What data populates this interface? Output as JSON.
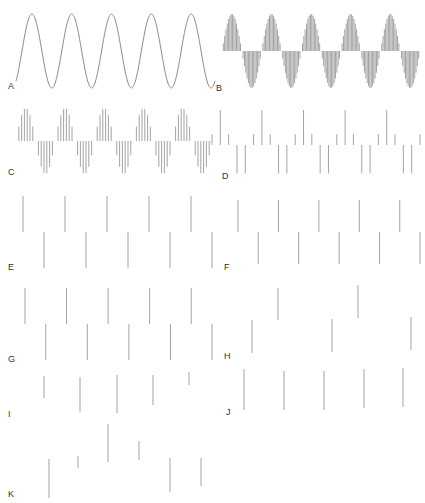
{
  "figure": {
    "stroke_color": "#8c8c8c",
    "label_color": "#333333"
  },
  "panels": [
    {
      "id": "A",
      "label": "A",
      "type": "continuous",
      "x0": 16,
      "x1": 215,
      "mid": 51,
      "amp": 37,
      "cycles": 5,
      "phase": -0.15,
      "label_x": 8,
      "label_y": 82
    },
    {
      "id": "B",
      "label": "B",
      "type": "sampled",
      "x0": 222,
      "x1": 420,
      "mid": 51,
      "amp": 37,
      "cycles": 5,
      "phase": 0.0,
      "samples_per_cycle": 30,
      "label_x": 216,
      "label_y": 84
    },
    {
      "id": "C",
      "label": "C",
      "type": "sampled",
      "x0": 16,
      "x1": 212,
      "mid": 141,
      "amp": 33,
      "cycles": 5,
      "phase": 0.0,
      "samples_per_cycle": 14,
      "label_x": 8,
      "label_y": 168
    },
    {
      "id": "D",
      "label": "D",
      "type": "sampled",
      "x0": 212,
      "x1": 420,
      "mid": 145,
      "amp": 35,
      "cycles": 5,
      "phase": 0.05,
      "samples_per_cycle": 5,
      "label_x": 222,
      "label_y": 172
    },
    {
      "id": "E",
      "label": "E",
      "type": "alternating",
      "x0": 23,
      "x1": 212,
      "mid": 232,
      "up_len": 36,
      "down_len": 36,
      "stems": 10,
      "label_x": 8,
      "label_y": 263
    },
    {
      "id": "F",
      "label": "F",
      "type": "alternating",
      "x0": 238,
      "x1": 420,
      "mid": 232,
      "up_len": 32,
      "down_len": 32,
      "stems": 10,
      "label_x": 224,
      "label_y": 263
    },
    {
      "id": "G",
      "label": "G",
      "type": "alternating",
      "x0": 25,
      "x1": 212,
      "mid": 324,
      "up_len": 36,
      "down_len": 36,
      "stems": 10,
      "label_x": 8,
      "label_y": 355
    },
    {
      "id": "H",
      "label": "H",
      "type": "custom",
      "stems_data": [
        [
          252,
          320,
          353
        ],
        [
          278,
          288,
          320
        ],
        [
          332,
          319,
          352
        ],
        [
          358,
          285,
          318
        ],
        [
          411,
          317,
          350
        ]
      ],
      "label_x": 224,
      "label_y": 352
    },
    {
      "id": "I",
      "label": "I",
      "type": "custom",
      "stems_data": [
        [
          44,
          376,
          398
        ],
        [
          80,
          377,
          412
        ],
        [
          117,
          375,
          413
        ],
        [
          153,
          375,
          405
        ],
        [
          189,
          372,
          385
        ]
      ],
      "label_x": 8,
      "label_y": 410
    },
    {
      "id": "J",
      "label": "J",
      "type": "custom",
      "stems_data": [
        [
          244,
          369,
          410
        ],
        [
          284,
          371,
          410
        ],
        [
          324,
          371,
          410
        ],
        [
          364,
          369,
          408
        ],
        [
          403,
          368,
          407
        ]
      ],
      "label_x": 226,
      "label_y": 408
    },
    {
      "id": "K",
      "label": "K",
      "type": "custom",
      "stems_data": [
        [
          49,
          459,
          498
        ],
        [
          78,
          456,
          468
        ],
        [
          108,
          424,
          462
        ],
        [
          139,
          441,
          460
        ],
        [
          170,
          458,
          492
        ],
        [
          201,
          458,
          486
        ]
      ],
      "label_x": 8,
      "label_y": 490
    }
  ]
}
